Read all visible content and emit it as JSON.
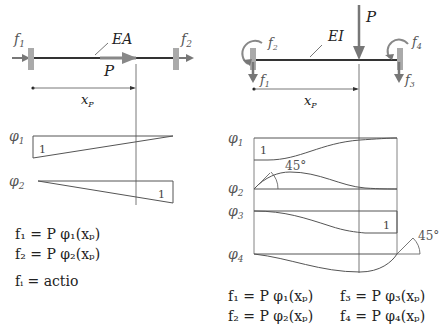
{
  "left_panel": {
    "member_label": "EA",
    "load_label": "P",
    "force_labels": {
      "f1": "f",
      "f1_sub": "1",
      "f2": "f",
      "f2_sub": "2"
    },
    "dimension_label": "x",
    "dimension_sub": "P",
    "shape_functions": [
      {
        "name": "φ",
        "sub": "1",
        "unit_label": "1"
      },
      {
        "name": "φ",
        "sub": "2",
        "unit_label": "1"
      }
    ],
    "formulas": [
      "f₁ = P φ₁(xₚ)",
      "f₂ = P φ₂(xₚ)",
      "fᵢ = actio"
    ]
  },
  "right_panel": {
    "member_label": "EI",
    "load_label": "P",
    "force_labels": {
      "f1": "f",
      "f1_sub": "1",
      "f2": "f",
      "f2_sub": "2",
      "f3": "f",
      "f3_sub": "3",
      "f4": "f",
      "f4_sub": "4"
    },
    "dimension_label": "x",
    "dimension_sub": "P",
    "shape_functions": [
      {
        "name": "φ",
        "sub": "1",
        "unit_label": "1"
      },
      {
        "name": "φ",
        "sub": "2",
        "angle_label": "45°"
      },
      {
        "name": "φ",
        "sub": "3",
        "unit_label": "1"
      },
      {
        "name": "φ",
        "sub": "4",
        "angle_label": "45°"
      }
    ],
    "formulas": [
      "f₁ = P φ₁(xₚ)",
      "f₃ = P φ₃(xₚ)",
      "f₂ = P φ₂(xₚ)",
      "f₄ = P φ₄(xₚ)"
    ]
  },
  "colors": {
    "arrow": "#777777",
    "support": "#aaaaaa",
    "beam": "#333333",
    "line": "#555555",
    "label": "#666666"
  }
}
